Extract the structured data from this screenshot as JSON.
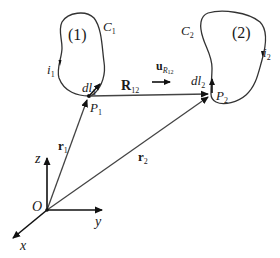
{
  "figure": {
    "loop1": {
      "curve_label": "C",
      "curve_sub": "1",
      "region_label": "(1)",
      "current_label": "i",
      "current_sub": "1",
      "element_label": "dl",
      "element_sub": "1",
      "point_label": "P",
      "point_sub": "1"
    },
    "loop2": {
      "curve_label": "C",
      "curve_sub": "2",
      "region_label": "(2)",
      "current_label": "i",
      "current_sub": "2",
      "element_label": "dl",
      "element_sub": "2",
      "point_label": "P",
      "point_sub": "2"
    },
    "vectors": {
      "r1": {
        "label": "r",
        "sub": "1"
      },
      "r2": {
        "label": "r",
        "sub": "2"
      },
      "R12": {
        "label": "R",
        "sub": "12"
      },
      "unit": {
        "label": "u",
        "sub": "R",
        "subsub": "12"
      }
    },
    "axes": {
      "origin": "O",
      "x": "x",
      "y": "y",
      "z": "z"
    },
    "colors": {
      "ink": "#1a1a1a",
      "line": "#333333"
    }
  }
}
